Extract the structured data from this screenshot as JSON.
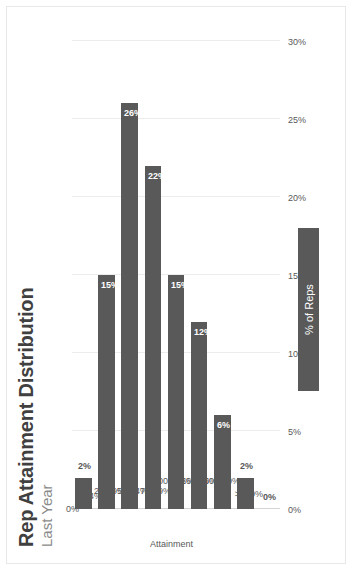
{
  "title": "Rep Attainment Distribution",
  "subtitle": "Last Year",
  "legend": {
    "label": "% of Reps"
  },
  "axes": {
    "category_title": "Attainment",
    "value_ticks": [
      "0%",
      "5%",
      "10%",
      "15%",
      "20%",
      "25%",
      "30%"
    ]
  },
  "colors": {
    "bar": "#595959",
    "gridline": "#ececed",
    "axis": "#d4d4d4",
    "title": "#404040",
    "subtitle": "#8b8b8b",
    "tick_text": "#595959",
    "label_inside": "#ffffff",
    "background": "#ffffff"
  },
  "chart_data": {
    "type": "bar",
    "orientation": "horizontal",
    "title": "Rep Attainment Distribution",
    "subtitle": "Last Year",
    "xlabel": "Attainment",
    "ylabel": "% of Reps",
    "categories": [
      "0%",
      "1-24%",
      "25-49%",
      "50-74%",
      "75-99%",
      "100-125%",
      "126-150%",
      "150-200%",
      ">200%"
    ],
    "values": [
      2,
      15,
      26,
      22,
      15,
      12,
      6,
      2,
      0
    ],
    "data_labels": [
      "2%",
      "15%",
      "26%",
      "22%",
      "15%",
      "12%",
      "6%",
      "2%",
      "0%"
    ],
    "series": [
      {
        "name": "% of Reps",
        "values": [
          2,
          15,
          26,
          22,
          15,
          12,
          6,
          2,
          0
        ]
      }
    ],
    "ylim": [
      0,
      30
    ],
    "tick_step": 5,
    "grid": true,
    "legend_position": "bottom"
  }
}
